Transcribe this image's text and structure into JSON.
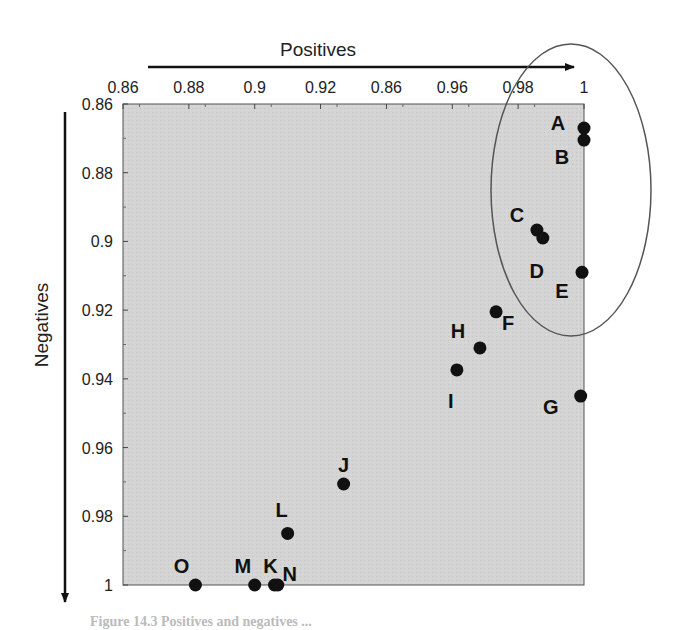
{
  "chart_data": {
    "type": "scatter",
    "title": "",
    "xlabel": "Positives",
    "ylabel": "Negatives",
    "x_axis_position": "top",
    "y_axis_inverted": true,
    "xlim": [
      0.86,
      1.0
    ],
    "ylim": [
      0.86,
      1.0
    ],
    "x_tick_labels": [
      "0.86",
      "0.88",
      "0.9",
      "0.92",
      "0.86",
      "0.96",
      "0.98",
      "1"
    ],
    "y_tick_labels": [
      "0.86",
      "0.88",
      "0.9",
      "0.92",
      "0.94",
      "0.96",
      "0.98",
      "1"
    ],
    "grid": false,
    "background": "#d3d3d3",
    "points": [
      {
        "label": "A",
        "x": 1.0,
        "y": 0.867
      },
      {
        "label": "B",
        "x": 1.0,
        "y": 0.8705
      },
      {
        "label": "C",
        "x": 0.9857,
        "y": 0.8967
      },
      {
        "label": "D",
        "x": 0.9875,
        "y": 0.899
      },
      {
        "label": "E",
        "x": 0.9994,
        "y": 0.909
      },
      {
        "label": "F",
        "x": 0.9733,
        "y": 0.9205
      },
      {
        "label": "H",
        "x": 0.9684,
        "y": 0.931
      },
      {
        "label": "I",
        "x": 0.9614,
        "y": 0.9374
      },
      {
        "label": "G",
        "x": 0.999,
        "y": 0.945
      },
      {
        "label": "J",
        "x": 0.927,
        "y": 0.9706
      },
      {
        "label": "L",
        "x": 0.91,
        "y": 0.985
      },
      {
        "label": "O",
        "x": 0.882,
        "y": 1.0
      },
      {
        "label": "M",
        "x": 0.9,
        "y": 1.0
      },
      {
        "label": "K",
        "x": 0.906,
        "y": 1.0
      },
      {
        "label": "N",
        "x": 0.907,
        "y": 1.0
      }
    ],
    "annotations": [
      {
        "type": "ellipse",
        "encloses": [
          "A",
          "B",
          "C",
          "D",
          "E"
        ]
      }
    ]
  },
  "caption": "Figure 14.3 Positives and negatives ..."
}
